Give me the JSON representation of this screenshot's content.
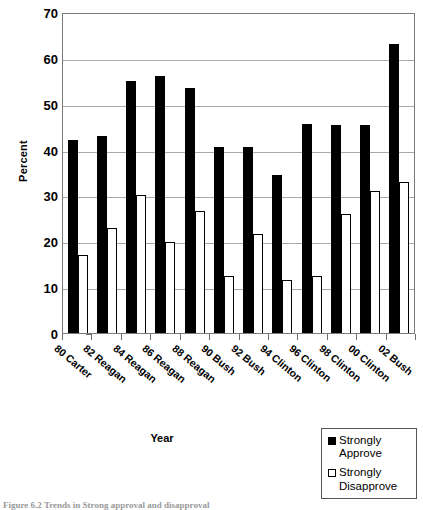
{
  "chart_data": {
    "type": "bar",
    "title": "",
    "xlabel": "Year",
    "ylabel": "Percent",
    "ylim": [
      0,
      70
    ],
    "ytick_step": 10,
    "yticks": [
      70,
      60,
      50,
      40,
      30,
      20,
      10,
      0
    ],
    "grid": true,
    "legend_position": "bottom-right",
    "categories": [
      "80 Carter",
      "82 Reagan",
      "84 Reagan",
      "86 Reagan",
      "88 Reagan",
      "90 Bush",
      "92 Bush",
      "94 Clinton",
      "96 Clinton",
      "98 Clinton",
      "00 Clinton",
      "02 Bush"
    ],
    "series": [
      {
        "name": "Strongly Approve",
        "color": "#000000",
        "style": "filled",
        "values": [
          42.0,
          43.0,
          55.0,
          56.0,
          53.5,
          40.5,
          40.5,
          34.5,
          45.5,
          45.3,
          45.3,
          63.0
        ]
      },
      {
        "name": "Strongly Disapprove",
        "color": "#ffffff",
        "style": "outlined",
        "values": [
          17.0,
          23.0,
          30.0,
          19.8,
          26.5,
          12.5,
          21.5,
          11.5,
          12.5,
          26.0,
          31.0,
          33.0
        ]
      }
    ]
  },
  "axes": {
    "y_title": "Percent",
    "x_title": "Year"
  },
  "legend": {
    "entries": [
      {
        "label_line1": "Strongly",
        "label_line2": "Approve",
        "swatch": "filled-square-icon"
      },
      {
        "label_line1": "Strongly",
        "label_line2": "Disapprove",
        "swatch": "outlined-square-icon"
      }
    ]
  },
  "caption": {
    "text": "Figure 6.2   Trends in Strong approval and disapproval"
  }
}
